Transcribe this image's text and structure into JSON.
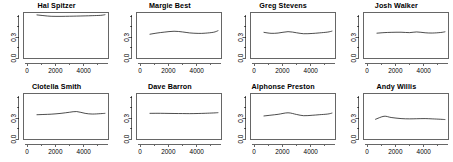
{
  "figure": {
    "layout": "2 rows x 4 columns of small-multiple line plots",
    "background_color": "#ffffff",
    "line_color": "#000000",
    "axis_color": "#000000"
  },
  "chart_data": [
    {
      "type": "line",
      "title": "Hal Spitzer",
      "xlabel": "",
      "ylabel": "",
      "xlim": [
        -250,
        5750
      ],
      "ylim": [
        0.0,
        0.66
      ],
      "xticks": [
        0,
        2000,
        4000
      ],
      "xtick_labels": [
        "0",
        "2000",
        "4000"
      ],
      "xminor_ticks": [
        1000,
        3000,
        5000
      ],
      "yticks": [
        0.0,
        0.3
      ],
      "ytick_labels": [
        "0.0",
        "0.3"
      ],
      "yminor_ticks": [
        0.15,
        0.45,
        0.6
      ],
      "grid": false,
      "legend": "none",
      "x": [
        700,
        1200,
        1700,
        2400,
        3000,
        3500,
        4100,
        4600,
        5200,
        5500
      ],
      "y": [
        0.625,
        0.614,
        0.605,
        0.604,
        0.606,
        0.608,
        0.611,
        0.614,
        0.619,
        0.628
      ]
    },
    {
      "type": "line",
      "title": "Margie Best",
      "xlabel": "",
      "ylabel": "",
      "xlim": [
        -250,
        5750
      ],
      "ylim": [
        0.0,
        0.66
      ],
      "xticks": [
        0,
        2000,
        4000
      ],
      "xtick_labels": [
        "0",
        "2000",
        "4000"
      ],
      "xminor_ticks": [
        1000,
        3000,
        5000
      ],
      "yticks": [
        0.0,
        0.3
      ],
      "ytick_labels": [
        "0.0",
        "0.3"
      ],
      "yminor_ticks": [
        0.15,
        0.45,
        0.6
      ],
      "grid": false,
      "legend": "none",
      "x": [
        700,
        1200,
        1700,
        2400,
        3000,
        3500,
        4100,
        4600,
        5200,
        5500
      ],
      "y": [
        0.345,
        0.362,
        0.375,
        0.388,
        0.378,
        0.364,
        0.357,
        0.36,
        0.374,
        0.396
      ]
    },
    {
      "type": "line",
      "title": "Greg Stevens",
      "xlabel": "",
      "ylabel": "",
      "xlim": [
        -250,
        5750
      ],
      "ylim": [
        0.0,
        0.66
      ],
      "xticks": [
        0,
        2000,
        4000
      ],
      "xtick_labels": [
        "0",
        "2000",
        "4000"
      ],
      "xminor_ticks": [
        1000,
        3000,
        5000
      ],
      "yticks": [
        0.0,
        0.3
      ],
      "ytick_labels": [
        "0.0",
        "0.3"
      ],
      "yminor_ticks": [
        0.15,
        0.45,
        0.6
      ],
      "grid": false,
      "legend": "none",
      "x": [
        700,
        1200,
        1700,
        2400,
        3000,
        3500,
        4100,
        4600,
        5200,
        5500
      ],
      "y": [
        0.372,
        0.358,
        0.362,
        0.382,
        0.366,
        0.352,
        0.356,
        0.364,
        0.376,
        0.39
      ]
    },
    {
      "type": "line",
      "title": "Josh Walker",
      "xlabel": "",
      "ylabel": "",
      "xlim": [
        -250,
        5750
      ],
      "ylim": [
        0.0,
        0.66
      ],
      "xticks": [
        0,
        2000,
        4000
      ],
      "xtick_labels": [
        "0",
        "2000",
        "4000"
      ],
      "xminor_ticks": [
        1000,
        3000,
        5000
      ],
      "yticks": [
        0.0,
        0.3
      ],
      "ytick_labels": [
        "0.0",
        "0.3"
      ],
      "yminor_ticks": [
        0.15,
        0.45,
        0.6
      ],
      "grid": false,
      "legend": "none",
      "x": [
        700,
        1200,
        1700,
        2400,
        3000,
        3500,
        4100,
        4600,
        5200,
        5500
      ],
      "y": [
        0.36,
        0.368,
        0.372,
        0.374,
        0.368,
        0.378,
        0.366,
        0.362,
        0.37,
        0.38
      ]
    },
    {
      "type": "line",
      "title": "Clotella Smith",
      "xlabel": "",
      "ylabel": "",
      "xlim": [
        -250,
        5750
      ],
      "ylim": [
        0.0,
        0.66
      ],
      "xticks": [
        0,
        2000,
        4000
      ],
      "xtick_labels": [
        "0",
        "2000",
        "4000"
      ],
      "xminor_ticks": [
        1000,
        3000,
        5000
      ],
      "yticks": [
        0.0,
        0.3
      ],
      "ytick_labels": [
        "0.0",
        "0.3"
      ],
      "yminor_ticks": [
        0.15,
        0.45,
        0.6
      ],
      "grid": false,
      "legend": "none",
      "x": [
        700,
        1200,
        1700,
        2400,
        3000,
        3500,
        4100,
        4600,
        5200,
        5500
      ],
      "y": [
        0.352,
        0.356,
        0.36,
        0.372,
        0.388,
        0.398,
        0.372,
        0.362,
        0.368,
        0.372
      ]
    },
    {
      "type": "line",
      "title": "Dave Barron",
      "xlabel": "",
      "ylabel": "",
      "xlim": [
        -250,
        5750
      ],
      "ylim": [
        0.0,
        0.66
      ],
      "xticks": [
        0,
        2000,
        4000
      ],
      "xtick_labels": [
        "0",
        "2000",
        "4000"
      ],
      "xminor_ticks": [
        1000,
        3000,
        5000
      ],
      "yticks": [
        0.0,
        0.3
      ],
      "ytick_labels": [
        "0.0",
        "0.3"
      ],
      "yminor_ticks": [
        0.15,
        0.45,
        0.6
      ],
      "grid": false,
      "legend": "none",
      "x": [
        700,
        1200,
        1700,
        2400,
        3000,
        3500,
        4100,
        4600,
        5200,
        5500
      ],
      "y": [
        0.372,
        0.373,
        0.372,
        0.37,
        0.369,
        0.368,
        0.37,
        0.373,
        0.378,
        0.382
      ]
    },
    {
      "type": "line",
      "title": "Alphonse Preston",
      "xlabel": "",
      "ylabel": "",
      "xlim": [
        -250,
        5750
      ],
      "ylim": [
        0.0,
        0.66
      ],
      "xticks": [
        0,
        2000,
        4000
      ],
      "xtick_labels": [
        "0",
        "2000",
        "4000"
      ],
      "xminor_ticks": [
        1000,
        3000,
        5000
      ],
      "yticks": [
        0.0,
        0.3
      ],
      "ytick_labels": [
        "0.0",
        "0.3"
      ],
      "yminor_ticks": [
        0.15,
        0.45,
        0.6
      ],
      "grid": false,
      "legend": "none",
      "x": [
        700,
        1200,
        1700,
        2400,
        3000,
        3500,
        4100,
        4600,
        5200,
        5500
      ],
      "y": [
        0.334,
        0.346,
        0.358,
        0.38,
        0.356,
        0.338,
        0.344,
        0.352,
        0.362,
        0.376
      ]
    },
    {
      "type": "line",
      "title": "Andy Willis",
      "xlabel": "",
      "ylabel": "",
      "xlim": [
        -250,
        5750
      ],
      "ylim": [
        0.0,
        0.66
      ],
      "xticks": [
        0,
        2000,
        4000
      ],
      "xtick_labels": [
        "0",
        "2000",
        "4000"
      ],
      "xminor_ticks": [
        1000,
        3000,
        5000
      ],
      "yticks": [
        0.0,
        0.3
      ],
      "ytick_labels": [
        "0.0",
        "0.3"
      ],
      "yminor_ticks": [
        0.15,
        0.45,
        0.6
      ],
      "grid": false,
      "legend": "none",
      "x": [
        600,
        1200,
        1700,
        2400,
        3000,
        3500,
        4100,
        4600,
        5200,
        5500
      ],
      "y": [
        0.286,
        0.33,
        0.312,
        0.296,
        0.292,
        0.294,
        0.296,
        0.292,
        0.286,
        0.282
      ]
    }
  ]
}
